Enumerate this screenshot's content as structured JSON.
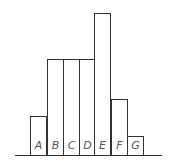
{
  "chart_data": {
    "type": "bar",
    "title": "",
    "xlabel": "",
    "ylabel": "",
    "categories": [
      "A",
      "B",
      "C",
      "D",
      "E",
      "F",
      "G"
    ],
    "values": [
      2,
      5,
      5,
      5,
      7.4,
      2.9,
      1
    ],
    "pixel_heights": [
      39,
      96,
      96,
      96,
      142,
      56,
      19
    ],
    "grid": false,
    "legend": null,
    "axes_visible": {
      "x_baseline": true,
      "y_axis": false,
      "ticks": false
    },
    "bar_fill": "#ffffff",
    "bar_stroke": "#333333",
    "label_color": "#555555",
    "label_position": "inside-bottom"
  },
  "layout": {
    "baseline_y": 155,
    "baseline_x_start": 15,
    "baseline_x_end": 162,
    "bar_lefts": [
      30,
      47,
      63,
      79,
      94,
      111,
      127
    ],
    "bar_width": 16,
    "bar_tops": [
      116,
      59,
      59,
      59,
      13,
      99,
      136
    ]
  }
}
